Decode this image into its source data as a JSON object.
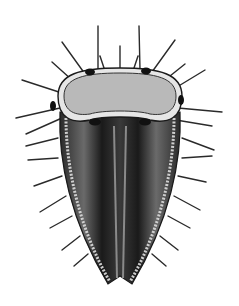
{
  "image": {
    "subject": "spiny seed illustration",
    "background": "#ffffff",
    "colors": {
      "dark": "#1c1c1c",
      "mid": "#555555",
      "cap_fill": "#b9b9b9",
      "rim": "#e6e6e6",
      "ribs": "#8a8a8a"
    }
  }
}
